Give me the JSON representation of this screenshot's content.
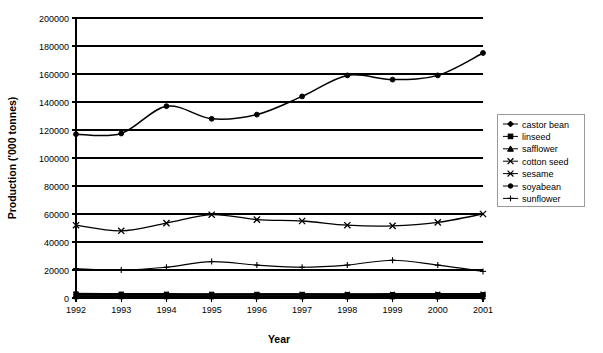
{
  "chart_data": {
    "type": "line",
    "title": "",
    "xlabel": "Year",
    "ylabel": "Production ('000 tonnes)",
    "categories": [
      "1992",
      "1993",
      "1994",
      "1995",
      "1996",
      "1997",
      "1998",
      "1999",
      "2000",
      "2001"
    ],
    "x": [
      1992,
      1993,
      1994,
      1995,
      1996,
      1997,
      1998,
      1999,
      2000,
      2001
    ],
    "ylim": [
      0,
      200000
    ],
    "xlim": [
      1992,
      2001
    ],
    "yticks": [
      0,
      20000,
      40000,
      60000,
      80000,
      100000,
      120000,
      140000,
      160000,
      180000,
      200000
    ],
    "ytick_labels": [
      "0",
      "20000",
      "40000",
      "60000",
      "80000",
      "100000",
      "120000",
      "140000",
      "160000",
      "180000",
      "200000"
    ],
    "grid": "horizontal",
    "legend_position": "right",
    "series": [
      {
        "name": "castor bean",
        "marker": "diamond",
        "values": [
          1150,
          1180,
          1210,
          1250,
          1230,
          1260,
          1280,
          1300,
          1320,
          1350
        ]
      },
      {
        "name": "linseed",
        "marker": "square",
        "values": [
          2900,
          2750,
          2700,
          2650,
          2600,
          2550,
          2500,
          2450,
          2400,
          2350
        ]
      },
      {
        "name": "safflower",
        "marker": "triangle",
        "values": [
          900,
          880,
          860,
          840,
          820,
          800,
          790,
          780,
          770,
          760
        ]
      },
      {
        "name": "cotton seed",
        "marker": "x",
        "values": [
          52000,
          48000,
          53500,
          59500,
          56000,
          55000,
          52000,
          51500,
          54000,
          60000
        ]
      },
      {
        "name": "sesame",
        "marker": "asterisk",
        "values": [
          2400,
          2350,
          2450,
          2500,
          2550,
          2600,
          2650,
          2700,
          2750,
          2800
        ]
      },
      {
        "name": "soyabean",
        "marker": "circle",
        "values": [
          117000,
          117500,
          137000,
          128000,
          131000,
          144000,
          159000,
          156000,
          159000,
          175000
        ]
      },
      {
        "name": "sunflower",
        "marker": "plus",
        "values": [
          21000,
          20000,
          22000,
          26000,
          23500,
          22000,
          23500,
          27000,
          23500,
          19000
        ]
      }
    ]
  },
  "axis": {
    "y_title": "Production ('000 tonnes)",
    "x_title": "Year"
  },
  "legend": {
    "items": [
      {
        "label": "castor bean"
      },
      {
        "label": "linseed"
      },
      {
        "label": "safflower"
      },
      {
        "label": "cotton seed"
      },
      {
        "label": "sesame"
      },
      {
        "label": "soyabean"
      },
      {
        "label": "sunflower"
      }
    ]
  }
}
